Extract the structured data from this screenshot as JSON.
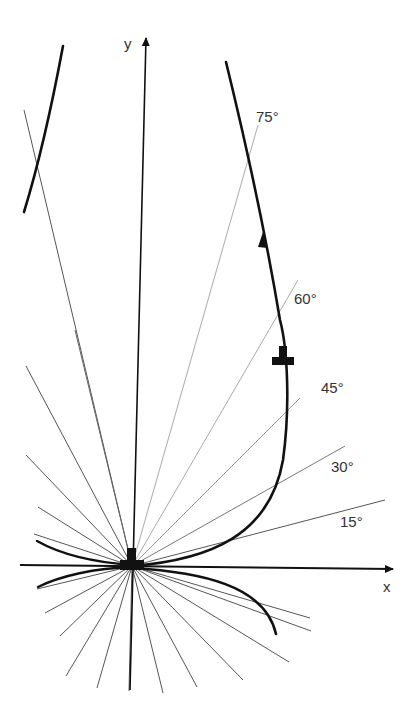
{
  "diagram": {
    "type": "phase-plane direction field",
    "origin": [
      132,
      566
    ],
    "axes": {
      "x": {
        "label": "x",
        "end": [
          395,
          570
        ],
        "label_pos": [
          387,
          592
        ]
      },
      "y": {
        "label": "y",
        "end": [
          146,
          36
        ],
        "label_pos": [
          130,
          48
        ]
      }
    },
    "angle_labels": [
      {
        "text": "75°",
        "pos": [
          256,
          121
        ]
      },
      {
        "text": "60°",
        "pos": [
          294,
          303
        ]
      },
      {
        "text": "45°",
        "pos": [
          321,
          392
        ]
      },
      {
        "text": "30°",
        "pos": [
          331,
          471
        ]
      },
      {
        "text": "15°",
        "pos": [
          340,
          526
        ]
      }
    ],
    "colors": {
      "ink": "#111111",
      "thin_line": "#555555",
      "faint_line": "#aaaaaa",
      "background": "#ffffff"
    }
  }
}
